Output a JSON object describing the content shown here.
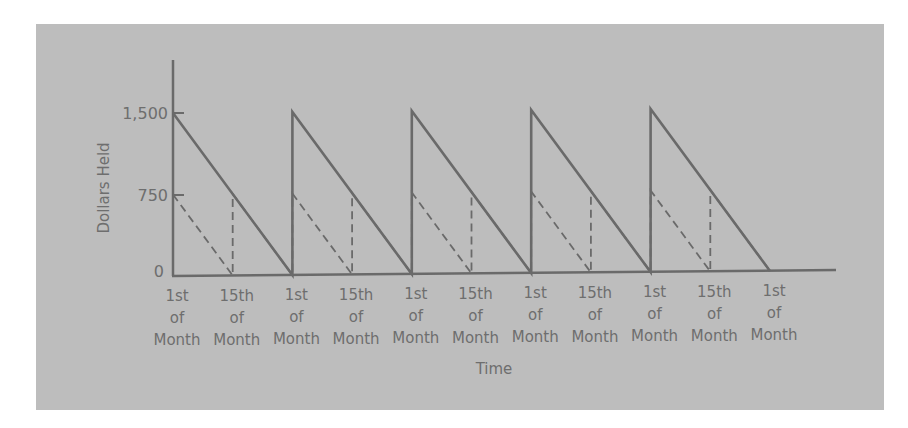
{
  "chart_data": {
    "type": "line",
    "title": "",
    "xlabel": "Time",
    "ylabel": "Dollars Held",
    "ylim": [
      0,
      1500
    ],
    "yticks": [
      "0",
      "750",
      "1,500"
    ],
    "ytick_values": [
      0,
      750,
      1500
    ],
    "grid": false,
    "legend": "none",
    "x_tick_labels": [
      [
        "1st",
        "of",
        "Month"
      ],
      [
        "15th",
        "of",
        "Month"
      ],
      [
        "1st",
        "of",
        "Month"
      ],
      [
        "15th",
        "of",
        "Month"
      ],
      [
        "1st",
        "of",
        "Month"
      ],
      [
        "15th",
        "of",
        "Month"
      ],
      [
        "1st",
        "of",
        "Month"
      ],
      [
        "15th",
        "of",
        "Month"
      ],
      [
        "1st",
        "of",
        "Month"
      ],
      [
        "15th",
        "of",
        "Month"
      ],
      [
        "1st",
        "of",
        "Month"
      ]
    ],
    "x": [
      0,
      0.5,
      1,
      1.5,
      2,
      2.5,
      3,
      3.5,
      4,
      4.5,
      5
    ],
    "series": [
      {
        "name": "Monthly pay (solid sawtooth)",
        "style": "solid",
        "points": [
          [
            0,
            1500
          ],
          [
            1,
            0
          ],
          [
            1,
            1500
          ],
          [
            2,
            0
          ],
          [
            2,
            1500
          ],
          [
            3,
            0
          ],
          [
            3,
            1500
          ],
          [
            4,
            0
          ],
          [
            4,
            1500
          ],
          [
            5,
            0
          ]
        ]
      },
      {
        "name": "Semi-monthly pay (dashed sawtooth)",
        "style": "dashed",
        "points": [
          [
            0,
            750
          ],
          [
            0.5,
            0
          ],
          [
            0.5,
            750
          ],
          [
            1,
            0
          ],
          [
            1,
            750
          ],
          [
            1.5,
            0
          ],
          [
            1.5,
            750
          ],
          [
            2,
            0
          ],
          [
            2,
            750
          ],
          [
            2.5,
            0
          ],
          [
            2.5,
            750
          ],
          [
            3,
            0
          ],
          [
            3,
            750
          ],
          [
            3.5,
            0
          ],
          [
            3.5,
            750
          ],
          [
            4,
            0
          ],
          [
            4,
            750
          ],
          [
            4.5,
            0
          ],
          [
            4.5,
            750
          ],
          [
            5,
            0
          ]
        ]
      }
    ]
  },
  "labels": {
    "ylabel": "Dollars Held",
    "xlabel": "Time",
    "ytick_0": "0",
    "ytick_750": "750",
    "ytick_1500": "1,500",
    "x_line1": [
      "1st",
      "15th",
      "1st",
      "15th",
      "1st",
      "15th",
      "1st",
      "15th",
      "1st",
      "15th",
      "1st"
    ],
    "x_line2": [
      "of",
      "of",
      "of",
      "of",
      "of",
      "of",
      "of",
      "of",
      "of",
      "of",
      "of"
    ],
    "x_line3": [
      "Month",
      "Month",
      "Month",
      "Month",
      "Month",
      "Month",
      "Month",
      "Month",
      "Month",
      "Month",
      "Month"
    ]
  },
  "colors": {
    "panel": "#bdbdbd",
    "line": "#6a6a6a",
    "text": "#6e6e6e"
  }
}
